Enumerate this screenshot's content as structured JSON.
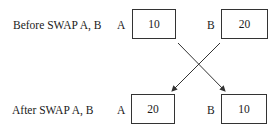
{
  "before": {
    "label": "Before SWAP A, B",
    "a": {
      "name": "A",
      "value": "10"
    },
    "b": {
      "name": "B",
      "value": "20"
    }
  },
  "after": {
    "label": "After SWAP A, B",
    "a": {
      "name": "A",
      "value": "20"
    },
    "b": {
      "name": "B",
      "value": "10"
    }
  },
  "arrows": [
    {
      "from": "before.a",
      "to": "after.b"
    },
    {
      "from": "before.b",
      "to": "after.a"
    }
  ],
  "colors": {
    "line": "#333333",
    "text": "#1a1a1a",
    "background": "#ffffff"
  }
}
